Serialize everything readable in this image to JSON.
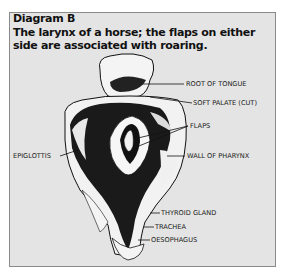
{
  "diagram": {
    "heading": "Diagram B",
    "caption_line1": "The larynx of a horse; the flaps on either",
    "caption_line2": "side are associated with roaring.",
    "background_color": "#e4e4e4",
    "border_color": "#8a8a8a"
  },
  "labels": {
    "root_of_tongue": "ROOT OF TONGUE",
    "soft_palate": "SOFT PALATE (CUT)",
    "flaps": "FLAPS",
    "epiglottis": "EPIGLOTTIS",
    "wall_of_pharynx": "WALL OF PHARYNX",
    "thyroid_gland": "THYROID GLAND",
    "trachea": "TRACHEA",
    "oesophagus": "OESOPHAGUS"
  }
}
